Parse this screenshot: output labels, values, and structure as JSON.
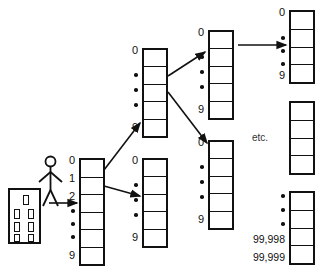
{
  "diagram": {
    "etc_label": "etc.",
    "colors": {
      "stroke": "#111111",
      "background": "#ffffff"
    },
    "actor": {
      "name": "stick-figure-person"
    },
    "building": {
      "name": "office-building",
      "window_rows": 4,
      "windows": [
        1,
        2,
        2,
        2
      ]
    },
    "columns": [
      {
        "id": "level-0-array",
        "cells": 6,
        "labels": [
          "0",
          "1",
          "2",
          "•",
          "•",
          "•",
          "9"
        ]
      },
      {
        "id": "level-1-array-upper",
        "cells": 5,
        "labels": [
          "0",
          "•",
          "•",
          "•",
          "9"
        ]
      },
      {
        "id": "level-1-array-lower",
        "cells": 5,
        "labels": [
          "0",
          "•",
          "•",
          "•",
          "9"
        ]
      },
      {
        "id": "level-2-array-upper",
        "cells": 5,
        "labels": [
          "0",
          "•",
          "•",
          "•",
          "9"
        ]
      },
      {
        "id": "level-2-array-lower",
        "cells": 5,
        "labels": [
          "0",
          "•",
          "•",
          "•",
          "9"
        ]
      },
      {
        "id": "level-3-array-top",
        "cells": 4,
        "labels": [
          "0",
          "•",
          "•",
          "•",
          "9"
        ]
      },
      {
        "id": "level-3-array-middle",
        "cells": 4,
        "labels": []
      },
      {
        "id": "level-3-array-bottom",
        "cells": 4,
        "labels": [
          "•",
          "•",
          "•",
          "99,998",
          "99,999"
        ]
      }
    ],
    "labels": {
      "zero": "0",
      "one": "1",
      "two": "2",
      "nine": "9",
      "dot": "•",
      "n99998": "99,998",
      "n99999": "99,999"
    }
  }
}
